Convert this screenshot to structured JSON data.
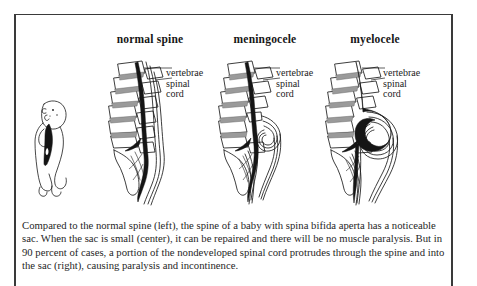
{
  "figure": {
    "panels": [
      {
        "id": "normal-spine",
        "title": "normal spine",
        "labels": [
          "vertebrae",
          "spinal",
          "cord"
        ]
      },
      {
        "id": "meningocele",
        "title": "meningocele",
        "labels": [
          "vertebrae",
          "spinal",
          "cord"
        ]
      },
      {
        "id": "myelocele",
        "title": "myelocele",
        "labels": [
          "vertebrae",
          "spinal",
          "cord"
        ]
      }
    ],
    "baby_figure": {
      "name": "infant-profile-illustration"
    },
    "caption": "Compared to the normal spine (left), the spine of a baby with spina bifida aperta has a noticeable sac. When the sac is small (center), it can be repaired and there will be no muscle paralysis. But in 90 percent of cases, a portion of the nondeveloped spinal cord protrudes through the spine and into the sac (right), causing paralysis and incontinence.",
    "colors": {
      "ink": "#1b1b1b",
      "frame": "#3a3a3a",
      "disc_shade": "#8d8d8d",
      "page": "#ffffff"
    }
  }
}
